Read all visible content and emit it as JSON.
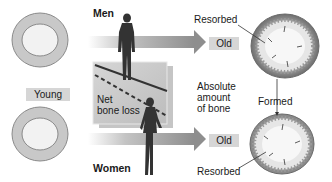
{
  "labels": {
    "men": "Men",
    "women": "Women",
    "young": "Young",
    "old_top": "Old",
    "old_bottom": "Old",
    "resorbed_top": "Resorbed",
    "resorbed_bottom": "Resorbed",
    "formed": "Formed",
    "net_bone_loss_line1": "Net",
    "net_bone_loss_line2": "bone loss",
    "absolute_line1": "Absolute",
    "absolute_line2": "amount",
    "absolute_line3": "of bone"
  },
  "colors": {
    "ring_fill": "#c8c8c8",
    "ring_stroke": "#8a8a8a",
    "inner_fill": "#f2f2f2",
    "tag_bg": "#d6d6d6",
    "arrow": "#9a9a9a",
    "silhouette": "#333333",
    "graph_bg": "#c9c9c9",
    "old_cortex": "#7a7a7a"
  }
}
